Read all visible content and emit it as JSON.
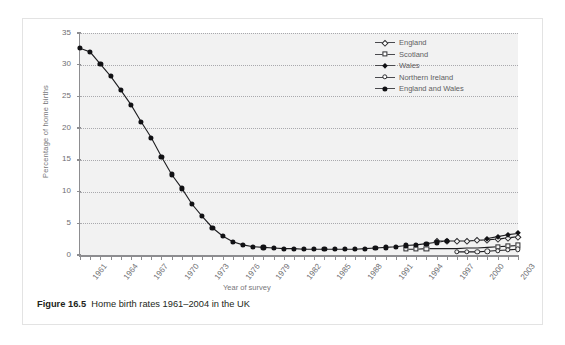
{
  "caption": {
    "figure_number": "Figure 16.5",
    "title": "Home birth rates 1961–2004 in the UK"
  },
  "chart_data": {
    "type": "line",
    "title": "",
    "xlabel": "Year of survey",
    "ylabel": "Percentage of home births",
    "xlim": [
      1961,
      2004
    ],
    "ylim": [
      0,
      35
    ],
    "yticks": [
      0,
      5,
      10,
      15,
      20,
      25,
      30,
      35
    ],
    "xticks_labeled": [
      1961,
      1964,
      1967,
      1970,
      1973,
      1976,
      1979,
      1982,
      1985,
      1988,
      1991,
      1994,
      1997,
      2000,
      2003
    ],
    "grid": "horizontal-dotted",
    "legend_position": "top-right",
    "series": [
      {
        "name": "England",
        "marker": "open-diamond",
        "x": [
          1996,
          1997,
          1998,
          1999,
          2000,
          2001,
          2002,
          2003,
          2004
        ],
        "values": [
          2.2,
          2.2,
          2.2,
          2.2,
          2.3,
          2.4,
          2.5,
          2.7,
          2.9
        ]
      },
      {
        "name": "Scotland",
        "marker": "open-square",
        "x": [
          1993,
          1994,
          1995,
          1996,
          1997,
          1998,
          1999,
          2000,
          2001,
          2002,
          2003,
          2004
        ],
        "values": [
          0.9,
          0.9,
          1.0,
          1.0,
          1.0,
          1.0,
          1.1,
          1.1,
          1.2,
          1.3,
          1.4,
          1.5
        ],
        "visible_x": [
          1993,
          1994,
          1995,
          2002,
          2003,
          2004
        ]
      },
      {
        "name": "Wales",
        "marker": "filled-diamond",
        "x": [
          2001,
          2002,
          2003,
          2004
        ],
        "values": [
          2.6,
          2.9,
          3.2,
          3.4
        ]
      },
      {
        "name": "Northern Ireland",
        "marker": "open-circle",
        "x": [
          1998,
          1999,
          2000,
          2001,
          2002,
          2003,
          2004
        ],
        "values": [
          0.5,
          0.5,
          0.5,
          0.6,
          0.7,
          0.8,
          0.9
        ]
      },
      {
        "name": "England and Wales",
        "marker": "filled-circle",
        "x": [
          1961,
          1962,
          1963,
          1964,
          1965,
          1966,
          1967,
          1968,
          1969,
          1970,
          1971,
          1972,
          1973,
          1974,
          1975,
          1976,
          1977,
          1978,
          1979,
          1980,
          1981,
          1982,
          1983,
          1984,
          1985,
          1986,
          1987,
          1988,
          1989,
          1990,
          1991,
          1992,
          1993,
          1994,
          1995,
          1996,
          1997
        ],
        "values": [
          32.6,
          32.0,
          30.1,
          28.2,
          26.0,
          23.7,
          21.0,
          18.5,
          15.5,
          12.7,
          10.5,
          8.0,
          6.1,
          4.3,
          3.0,
          2.1,
          1.6,
          1.3,
          1.2,
          1.1,
          1.0,
          1.0,
          0.9,
          0.9,
          0.9,
          0.9,
          0.9,
          0.9,
          1.0,
          1.1,
          1.2,
          1.3,
          1.5,
          1.6,
          1.8,
          2.0,
          2.2
        ]
      }
    ]
  }
}
